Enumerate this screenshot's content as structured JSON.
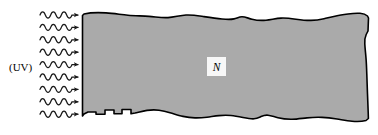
{
  "figure": {
    "background_color": "#ffffff",
    "width": 378,
    "height": 135
  },
  "labels": {
    "uv_source": "(UV)",
    "region": "N"
  },
  "radiation": {
    "icon_name": "wavy-arrow-icon",
    "description": "wavy arrow rays pointing right",
    "count": 9,
    "stroke_color": "#1a1a1a",
    "wave_cycles": 3,
    "first_ray_y": 15,
    "ray_spacing": 12.4,
    "wave_start_x": 40,
    "wave_end_x": 72,
    "arrow_tip_x": 78,
    "amplitude": 3.1
  },
  "material": {
    "name": "irregular-gray-region",
    "fill_color": "#aaaaaa",
    "stroke_color": "#000000",
    "stroke_width": 1.6,
    "left_edge_x": 82,
    "right_edge_x": 369,
    "top_edge_y": 13,
    "bottom_edge_y": 122,
    "outline_path": "M 82.5 15.5 L 84 14.0 C 90 12.6 98 12.4 106 12.9 C 114 13.4 121 14.6 128 15.2 C 135 15.8 142 15.9 149 16.4 C 156 16.9 162 18.0 168 17.6 C 174 17.2 180 15.4 186 15.0 C 192 14.6 198 15.7 204 16.6 C 210 17.5 216 18.4 222 19.0 C 227 19.5 231 19.6 234 18.9 C 237 18.2 239 16.8 242 16.8 C 245 16.8 248 18.2 252 19.2 C 256 20.2 261 20.7 266 20.2 C 271 19.7 276 18.4 281 18.1 C 286 17.8 291 18.5 296 19.2 C 301 19.9 306 20.5 311 20.4 C 316 20.3 320 19.6 324 18.7 C 328 17.8 332 16.8 336 16.0 C 340 15.2 344 14.6 348 14.0 C 352 13.4 356 13.0 360 13.3 C 364 13.6 366 14.6 367.5 16.0 L 368.5 18.0 L 368.0 31.0 L 366.2 34.5 C 365.0 37.0 364.6 40.0 364.8 44.0 C 365.0 48.0 365.6 53.0 366.0 58.0 C 366.4 63.0 366.6 68.0 366.8 74.0 C 367.0 80.0 367.2 87.0 367.5 94.0 C 367.8 101.0 368.0 107.0 368.2 112.0 L 368.4 118.5 L 366.0 120.5 C 362 121.6 357 121.8 352 121.3 C 347 120.8 342 119.8 337 119.0 C 332 118.2 327 117.6 322 117.4 C 317 117.2 312 117.4 307 117.9 C 302 118.4 297 119.2 292 119.3 C 287 119.4 282 118.8 278 117.8 C 274 116.8 271 115.5 268 115.2 C 265 114.9 263 115.7 261 116.6 C 259 117.5 257 118.6 254 118.8 C 251 119.0 247 118.3 243 117.5 C 239 116.7 235 115.9 231 115.5 C 227 115.1 223 115.2 219 115.6 C 215 116.0 211 116.7 207 117.2 C 203 117.7 199 118.0 195 117.9 C 191 117.8 187 117.3 183 116.4 C 179 115.5 175 114.2 171 113.0 C 167 111.8 163 110.7 159 110.2 C 155 109.7 151 109.8 147 110.4 C 143 111.0 139 112.1 135 113.0 L 131 113.8 L 131 109.5 L 122 109.5 L 122 113.8 L 114 113.8 L 114 110.0 L 105 110.0 L 105 114.2 L 96 114.2 L 96 112.0 L 88 112.0 L 84 114.0 L 82.5 116.0 Z"
  },
  "region_badge": {
    "name": "region-label-box",
    "x": 207,
    "y": 57,
    "width": 19,
    "height": 19,
    "fill_color": "#f7f7f7"
  },
  "uv_label_position": {
    "x": 9,
    "y": 71
  }
}
